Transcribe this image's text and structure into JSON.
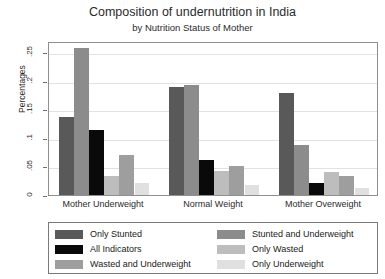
{
  "chart_data": {
    "type": "bar",
    "title": "Composition of undernutrition in India",
    "subtitle": "by Nutrition Status of Mother",
    "xlabel": "",
    "ylabel": "Percentages",
    "ylim": [
      0,
      0.27
    ],
    "yticks": [
      0,
      0.05,
      0.1,
      0.15,
      0.2,
      0.25
    ],
    "ytick_labels": [
      "0",
      ".05",
      ".1",
      ".15",
      ".2",
      ".25"
    ],
    "grid": true,
    "legend_position": "bottom",
    "categories": [
      "Mother Underweight",
      "Normal Weight",
      "Mother Overweight"
    ],
    "series": [
      {
        "name": "Only Stunted",
        "color": "#595959",
        "values": [
          0.137,
          0.189,
          0.178
        ]
      },
      {
        "name": "Stunted and Underweight",
        "color": "#8c8c8c",
        "values": [
          0.257,
          0.193,
          0.088
        ]
      },
      {
        "name": "All Indicators",
        "color": "#0a0a0a",
        "values": [
          0.114,
          0.062,
          0.021
        ]
      },
      {
        "name": "Only Wasted",
        "color": "#bdbdbd",
        "values": [
          0.034,
          0.042,
          0.04
        ]
      },
      {
        "name": "Wasted and Underweight",
        "color": "#9e9e9e",
        "values": [
          0.071,
          0.05,
          0.034
        ]
      },
      {
        "name": "Only Underweight",
        "color": "#e0e0e0",
        "values": [
          0.021,
          0.018,
          0.012
        ]
      }
    ],
    "legend_left_column": [
      "Only Stunted",
      "All Indicators",
      "Wasted and Underweight"
    ],
    "legend_right_column": [
      "Stunted and Underweight",
      "Only Wasted",
      "Only Underweight"
    ]
  }
}
